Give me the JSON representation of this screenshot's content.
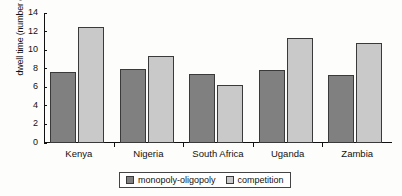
{
  "chart_data": {
    "type": "bar",
    "title": "",
    "xlabel": "",
    "ylabel": "dwell time (number of days)",
    "categories": [
      "Kenya",
      "Nigeria",
      "South Africa",
      "Uganda",
      "Zambia"
    ],
    "series": [
      {
        "name": "monopoly-oligopoly",
        "color": "#808080",
        "values": [
          7.6,
          8.0,
          7.4,
          7.9,
          7.3
        ]
      },
      {
        "name": "competition",
        "color": "#c9c9c9",
        "values": [
          12.5,
          9.35,
          6.2,
          11.3,
          10.8
        ]
      }
    ],
    "ylim": [
      0,
      14
    ],
    "yticks": [
      0,
      2,
      4,
      6,
      8,
      10,
      12,
      14
    ],
    "ytick_labels": [
      "0",
      "2",
      "4",
      "6",
      "8",
      "10",
      "12",
      "14"
    ],
    "grid": false,
    "legend_position": "bottom"
  }
}
